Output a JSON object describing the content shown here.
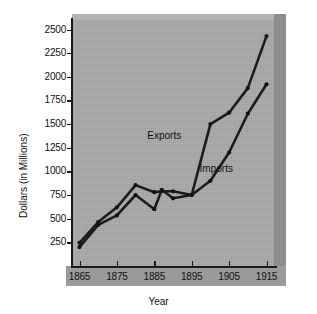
{
  "chart_data": {
    "type": "line",
    "title": "",
    "xlabel": "Year",
    "ylabel": "Dollars (in Millions)",
    "xlim": [
      1863,
      1917
    ],
    "ylim": [
      0,
      2600
    ],
    "grid": false,
    "legend_position": "inline-annotations",
    "xticks": [
      "1865",
      "1875",
      "1885",
      "1895",
      "1905",
      "1915"
    ],
    "xtick_values": [
      1865,
      1875,
      1885,
      1895,
      1905,
      1915
    ],
    "yticks": [
      "250",
      "500",
      "750",
      "1000",
      "1250",
      "1500",
      "1750",
      "2000",
      "2250",
      "2500"
    ],
    "ytick_values": [
      250,
      500,
      750,
      1000,
      1250,
      1500,
      1750,
      2000,
      2250,
      2500
    ],
    "series": [
      {
        "name": "Exports",
        "label": "Exports",
        "color": "#1c1c1c",
        "x": [
          1865,
          1870,
          1875,
          1880,
          1885,
          1887,
          1890,
          1895,
          1900,
          1905,
          1910,
          1915
        ],
        "values": [
          245,
          465,
          620,
          855,
          780,
          790,
          790,
          750,
          1500,
          1620,
          1880,
          2430
        ]
      },
      {
        "name": "Imports",
        "label": "Imports",
        "color": "#1c1c1c",
        "x": [
          1865,
          1870,
          1875,
          1880,
          1885,
          1887,
          1890,
          1895,
          1900,
          1905,
          1910,
          1915
        ],
        "values": [
          200,
          435,
          535,
          750,
          600,
          805,
          715,
          750,
          900,
          1200,
          1610,
          1920
        ]
      }
    ],
    "annotations": [
      {
        "text": "Exports",
        "x": 1889,
        "y": 1370
      },
      {
        "text": "Imports",
        "x": 1903,
        "y": 1030
      }
    ]
  }
}
